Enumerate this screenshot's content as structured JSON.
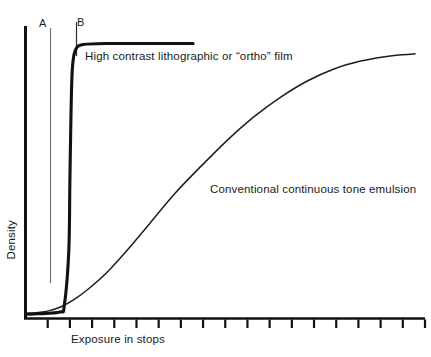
{
  "chart_data": {
    "type": "line",
    "title": "",
    "xlabel": "Exposure in stops",
    "ylabel": "Density",
    "xlim": [
      0,
      18
    ],
    "ylim": [
      0,
      1
    ],
    "grid": false,
    "legend_position": "inline-annotations",
    "axis_color": "#111111",
    "tick_count": 18,
    "tick_positions": [
      1,
      2,
      3,
      4,
      5,
      6,
      7,
      8,
      9,
      10,
      11,
      12,
      13,
      14,
      15,
      16,
      17,
      18
    ],
    "tick_labels": [],
    "series": [
      {
        "name": "High contrast  lithographic or “ortho” film",
        "color": "#111111",
        "width": 3.1,
        "x": [
          0.1,
          0.55,
          1.55,
          1.75,
          1.95,
          2.0,
          2.05,
          2.1,
          2.18,
          2.3,
          2.55,
          3.6,
          7.55
        ],
        "y": [
          0.015,
          0.016,
          0.022,
          0.045,
          0.23,
          0.47,
          0.7,
          0.84,
          0.9,
          0.925,
          0.936,
          0.94,
          0.94
        ]
      },
      {
        "name": "Conventional continuous tone emulsion",
        "color": "#1d1d1d",
        "width": 1.5,
        "x": [
          0.1,
          0.5,
          1.05,
          1.6,
          2.2,
          2.9,
          3.7,
          4.6,
          5.6,
          6.7,
          7.9,
          9.1,
          10.3,
          11.5,
          12.7,
          13.9,
          15.1,
          16.2,
          17.0,
          17.55
        ],
        "y": [
          0.018,
          0.02,
          0.026,
          0.04,
          0.065,
          0.105,
          0.16,
          0.235,
          0.325,
          0.425,
          0.52,
          0.61,
          0.69,
          0.757,
          0.812,
          0.853,
          0.88,
          0.895,
          0.902,
          0.905
        ]
      }
    ],
    "markers": [
      {
        "label": "A",
        "x_px": 50,
        "color": "#6f6f6f",
        "width": 1.1,
        "top_px": 28,
        "bottom_px": 283
      },
      {
        "label": "B",
        "x_px": 76,
        "color": "#2b2b2b",
        "width": 1.2,
        "top_px": 22,
        "bottom_px": 56
      }
    ],
    "annotations": [
      {
        "name": "high-contrast-label",
        "text": "High contrast  lithographic or “ortho” film"
      },
      {
        "name": "conventional-label",
        "text": "Conventional continuous tone emulsion"
      }
    ]
  },
  "axes": {
    "x_label": "Exposure in stops",
    "y_label": "Density"
  },
  "markers": {
    "a_label": "A",
    "b_label": "B"
  },
  "series_labels": {
    "high_contrast": "High contrast  lithographic or “ortho” film",
    "conventional": "Conventional continuous tone emulsion"
  }
}
